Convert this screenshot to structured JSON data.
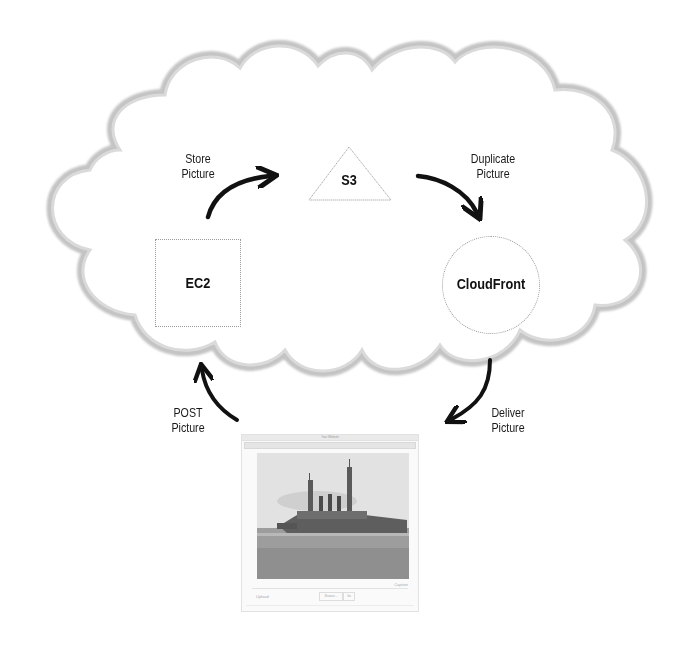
{
  "diagram": {
    "nodes": {
      "s3": {
        "label": "S3",
        "shape": "triangle"
      },
      "ec2": {
        "label": "EC2",
        "shape": "square"
      },
      "cloudfront": {
        "label": "CloudFront",
        "shape": "circle"
      }
    },
    "edges": {
      "store": {
        "from": "EC2",
        "to": "S3",
        "line1": "Store",
        "line2": "Picture"
      },
      "duplicate": {
        "from": "S3",
        "to": "CloudFront",
        "line1": "Duplicate",
        "line2": "Picture"
      },
      "deliver": {
        "from": "CloudFront",
        "to": "Browser",
        "line1": "Deliver",
        "line2": "Picture"
      },
      "post": {
        "from": "Browser",
        "to": "EC2",
        "line1": "POST",
        "line2": "Picture"
      }
    },
    "colors": {
      "cloud_outline": "#b8b8b8",
      "cloud_fill": "#ffffff",
      "arrow": "#111111",
      "node_border": "#9a9a9a"
    }
  },
  "browser_window": {
    "title": "Your Website",
    "photo_subject": "battleship",
    "caption": "Caption",
    "form_label": "Upload",
    "browse_label": "Browse...",
    "go_label": "Go"
  }
}
